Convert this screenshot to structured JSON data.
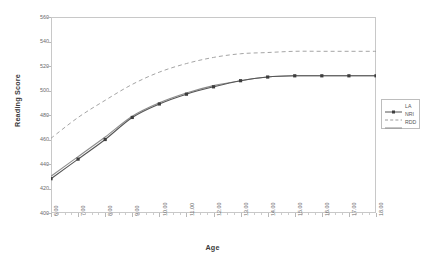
{
  "chart_data": {
    "type": "line",
    "title": "",
    "xlabel": "Age",
    "ylabel": "Reading Score",
    "xlim": [
      6,
      18
    ],
    "ylim": [
      400,
      560
    ],
    "grid": false,
    "legend_position": "right",
    "x_tick_labels": [
      "6.00",
      "7.00",
      "8.00",
      "9.00",
      "10.00",
      "11.00",
      "12.00",
      "13.00",
      "14.00",
      "15.00",
      "16.00",
      "17.00",
      "18.00"
    ],
    "y_tick_labels": [
      "400",
      "420",
      "440",
      "460",
      "480",
      "500",
      "520",
      "540",
      "560"
    ],
    "x": [
      6,
      7,
      8,
      9,
      10,
      11,
      12,
      13,
      14,
      15,
      16,
      17,
      18
    ],
    "series": [
      {
        "name": "LA",
        "style": "solid-with-markers",
        "color": "#555555",
        "marker": "square",
        "values": [
          428,
          444,
          460,
          478,
          489,
          497,
          503,
          508,
          511,
          512,
          512,
          512,
          512
        ]
      },
      {
        "name": "NRI",
        "style": "dashed",
        "color": "#9a9a9a",
        "marker": "none",
        "values": [
          461,
          478,
          492,
          505,
          515,
          522,
          527,
          530,
          531,
          532,
          532,
          532,
          532
        ]
      },
      {
        "name": "RDD",
        "style": "solid",
        "color": "#8d8d8d",
        "marker": "none",
        "values": [
          430,
          446,
          462,
          479,
          490,
          498,
          504,
          508,
          511,
          512,
          512,
          512,
          512
        ]
      }
    ]
  },
  "legend": {
    "items": [
      {
        "label": "LA"
      },
      {
        "label": "NRI"
      },
      {
        "label": "RDD"
      }
    ]
  },
  "axes": {
    "x_title": "Age",
    "y_title": "Reading Score"
  }
}
